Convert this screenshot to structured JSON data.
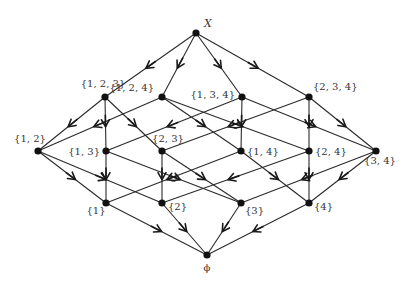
{
  "diagram": {
    "type": "hasse-diagram",
    "title": "",
    "arrow_direction": "from superset to subset",
    "colors": {
      "edge": "#2a2a2a",
      "node": "#111111",
      "label": "#333333"
    },
    "nodes": [
      {
        "id": "X",
        "label": "X",
        "x": 196,
        "y": 33,
        "lx": 204,
        "ly": 27,
        "anchor": "start",
        "italic": true
      },
      {
        "id": "123",
        "label": "{1, 2, 3}",
        "x": 105,
        "y": 97,
        "lx": 103,
        "ly": 87,
        "anchor": "middle"
      },
      {
        "id": "124",
        "label": "{1, 2, 4}",
        "x": 162,
        "y": 97,
        "lx": 154,
        "ly": 91,
        "anchor": "end"
      },
      {
        "id": "134",
        "label": "{1, 3, 4}",
        "x": 242,
        "y": 97,
        "lx": 235,
        "ly": 98,
        "anchor": "end"
      },
      {
        "id": "234",
        "label": "{2, 3, 4}",
        "x": 309,
        "y": 97,
        "lx": 313,
        "ly": 90,
        "anchor": "start"
      },
      {
        "id": "12",
        "label": "{1, 2}",
        "x": 38,
        "y": 151,
        "lx": 30,
        "ly": 142,
        "anchor": "middle"
      },
      {
        "id": "13",
        "label": "{1, 3}",
        "x": 106,
        "y": 151,
        "lx": 100,
        "ly": 155,
        "anchor": "end"
      },
      {
        "id": "23",
        "label": "{2, 3}",
        "x": 162,
        "y": 151,
        "lx": 168,
        "ly": 142,
        "anchor": "middle"
      },
      {
        "id": "14",
        "label": "{1, 4}",
        "x": 241,
        "y": 151,
        "lx": 247,
        "ly": 155,
        "anchor": "start"
      },
      {
        "id": "24",
        "label": "{2, 4}",
        "x": 309,
        "y": 151,
        "lx": 315,
        "ly": 155,
        "anchor": "start"
      },
      {
        "id": "34",
        "label": "{3, 4}",
        "x": 376,
        "y": 151,
        "lx": 380,
        "ly": 164,
        "anchor": "middle"
      },
      {
        "id": "1",
        "label": "{1}",
        "x": 106,
        "y": 203,
        "lx": 96,
        "ly": 214,
        "anchor": "middle"
      },
      {
        "id": "2",
        "label": "{2}",
        "x": 162,
        "y": 203,
        "lx": 168,
        "ly": 210,
        "anchor": "start"
      },
      {
        "id": "3",
        "label": "{3}",
        "x": 241,
        "y": 203,
        "lx": 245,
        "ly": 214,
        "anchor": "start"
      },
      {
        "id": "4",
        "label": "{4}",
        "x": 309,
        "y": 203,
        "lx": 314,
        "ly": 210,
        "anchor": "start"
      },
      {
        "id": "phi",
        "label": "ϕ",
        "x": 207,
        "y": 255,
        "lx": 207,
        "ly": 271,
        "anchor": "middle"
      }
    ],
    "edges": [
      [
        "X",
        "123"
      ],
      [
        "X",
        "124"
      ],
      [
        "X",
        "134"
      ],
      [
        "X",
        "234"
      ],
      [
        "123",
        "12"
      ],
      [
        "123",
        "13"
      ],
      [
        "123",
        "23"
      ],
      [
        "124",
        "12"
      ],
      [
        "124",
        "14"
      ],
      [
        "124",
        "24"
      ],
      [
        "134",
        "13"
      ],
      [
        "134",
        "14"
      ],
      [
        "134",
        "34"
      ],
      [
        "234",
        "23"
      ],
      [
        "234",
        "24"
      ],
      [
        "234",
        "34"
      ],
      [
        "12",
        "1"
      ],
      [
        "12",
        "2"
      ],
      [
        "13",
        "1"
      ],
      [
        "13",
        "3"
      ],
      [
        "23",
        "2"
      ],
      [
        "23",
        "3"
      ],
      [
        "14",
        "1"
      ],
      [
        "14",
        "4"
      ],
      [
        "24",
        "2"
      ],
      [
        "24",
        "4"
      ],
      [
        "34",
        "3"
      ],
      [
        "34",
        "4"
      ],
      [
        "1",
        "phi"
      ],
      [
        "2",
        "phi"
      ],
      [
        "3",
        "phi"
      ],
      [
        "4",
        "phi"
      ]
    ]
  }
}
